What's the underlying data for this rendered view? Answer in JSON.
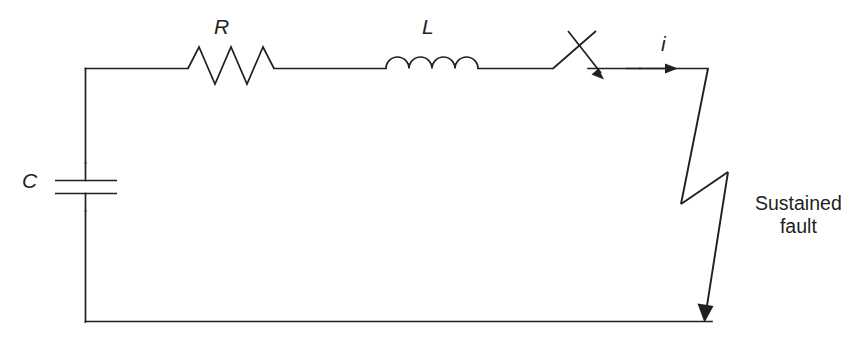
{
  "figure": {
    "background_color": "#ffffff",
    "line_color": "#231f20",
    "width": 852,
    "height": 340
  },
  "labels": {
    "resistor": "R",
    "inductor": "L",
    "capacitor": "C",
    "current": "i",
    "fault_line_1": "Sustained",
    "fault_line_2": "fault"
  },
  "components": [
    {
      "name": "capacitor",
      "symbol": "C",
      "type": "capacitor",
      "orientation": "vertical",
      "plates": 2
    },
    {
      "name": "resistor",
      "symbol": "R",
      "type": "resistor",
      "orientation": "horizontal",
      "zigzag_peaks": 3
    },
    {
      "name": "inductor",
      "symbol": "L",
      "type": "inductor",
      "orientation": "horizontal",
      "coils": 4
    },
    {
      "name": "switch",
      "symbol": "",
      "type": "switch-spark-gap",
      "orientation": "horizontal",
      "state": "closing"
    },
    {
      "name": "fault",
      "symbol": "",
      "type": "lightning-bolt-arrow",
      "orientation": "vertical"
    }
  ],
  "annotations": {
    "current_direction": "right",
    "fault_arrow_direction": "down"
  }
}
